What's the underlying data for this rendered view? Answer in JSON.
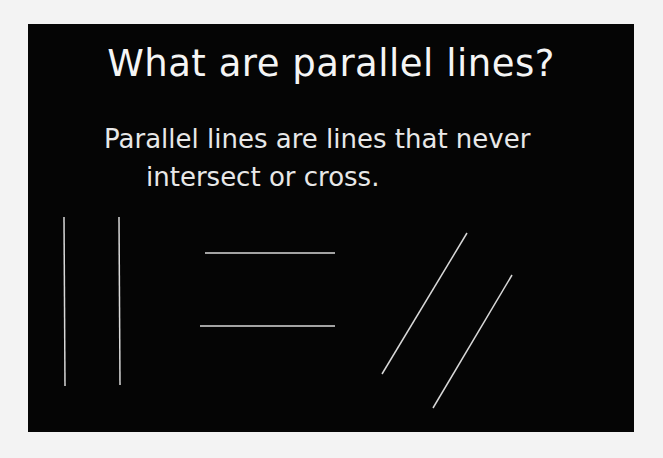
{
  "slide": {
    "title": "What are parallel lines?",
    "definition_line1": "Parallel lines are lines that never",
    "definition_line2": "intersect or cross.",
    "background_color": "#050505",
    "line_color": "#d8d8d8"
  },
  "illustrations": [
    {
      "name": "vertical-parallel-lines",
      "orientation": "vertical"
    },
    {
      "name": "horizontal-parallel-lines",
      "orientation": "horizontal"
    },
    {
      "name": "diagonal-parallel-lines",
      "orientation": "diagonal"
    }
  ]
}
